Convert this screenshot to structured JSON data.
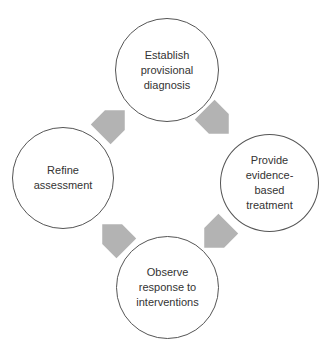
{
  "diagram": {
    "type": "cycle",
    "colors": {
      "arrow": "#b3b3b3",
      "circle_stroke": "#555555",
      "text": "#333333",
      "background": "#ffffff"
    },
    "nodes": [
      {
        "id": "top",
        "label": "Establish\nprovisional\ndiagnosis"
      },
      {
        "id": "right",
        "label": "Provide\nevidence-\nbased\ntreatment"
      },
      {
        "id": "bottom",
        "label": "Observe\nresponse to\ninterventions"
      },
      {
        "id": "left",
        "label": "Refine\nassessment"
      }
    ],
    "arrows": [
      {
        "from": "top",
        "to": "right",
        "direction": "down-right"
      },
      {
        "from": "right",
        "to": "bottom",
        "direction": "down-left"
      },
      {
        "from": "bottom",
        "to": "left",
        "direction": "up-left"
      },
      {
        "from": "left",
        "to": "top",
        "direction": "up-right"
      }
    ]
  }
}
